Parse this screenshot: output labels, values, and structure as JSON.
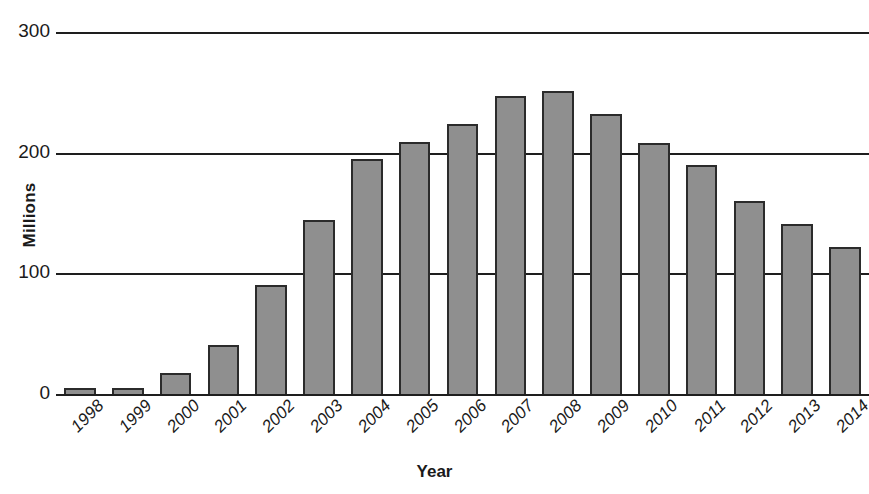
{
  "chart_data": {
    "type": "bar",
    "title": "",
    "subtitle": "",
    "xlabel": "Year",
    "ylabel": "Millions",
    "categories": [
      "1998",
      "1999",
      "2000",
      "2001",
      "2002",
      "2003",
      "2004",
      "2005",
      "2006",
      "2007",
      "2008",
      "2009",
      "2010",
      "2011",
      "2012",
      "2013",
      "2014"
    ],
    "values": [
      5,
      5,
      17,
      41,
      90,
      144,
      195,
      209,
      224,
      247,
      251,
      232,
      208,
      190,
      160,
      141,
      122
    ],
    "ylim": [
      0,
      300
    ],
    "yticks": [
      0,
      100,
      200,
      300
    ],
    "ytick_labels": [
      "0",
      "100",
      "200",
      "300"
    ],
    "grid": "horizontal",
    "legend": "none",
    "bar_fill_color": "#8f8f8f",
    "bar_edge_color": "#2b2b2b",
    "axis_color": "#1e1e1e",
    "background_color": "#ffffff",
    "xtick_rotation_deg": -45
  }
}
